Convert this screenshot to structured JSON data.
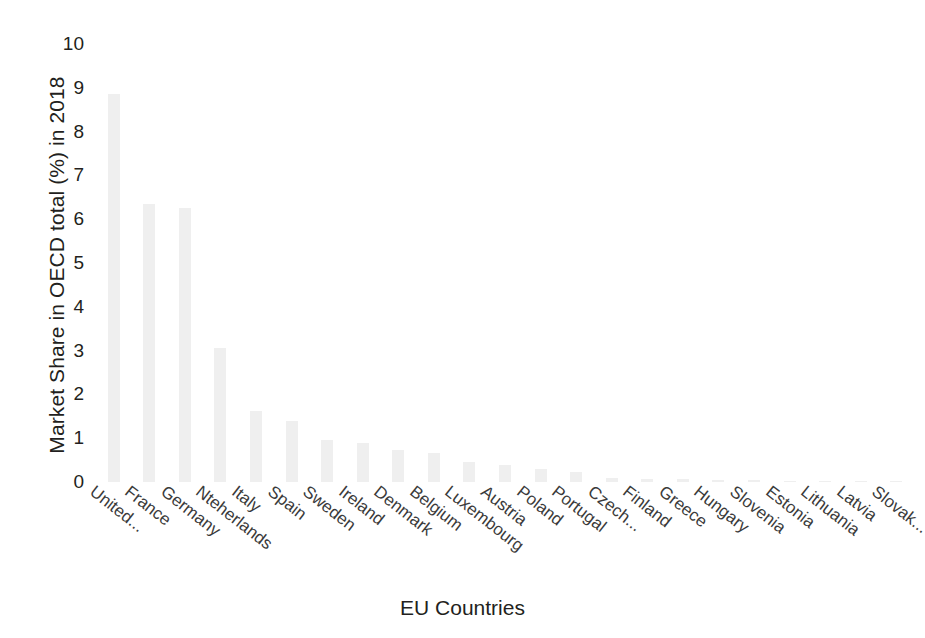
{
  "chart_data": {
    "type": "bar",
    "title": "",
    "xlabel": "EU Countries",
    "ylabel": "Market Share in OECD total (%) in 2018",
    "ylim": [
      0,
      10
    ],
    "yticks": [
      0,
      1,
      2,
      3,
      4,
      5,
      6,
      7,
      8,
      9,
      10
    ],
    "grid": false,
    "legend": "none",
    "bar_color": "#efefef",
    "categories": [
      "United...",
      "France",
      "Germany",
      "Nteherlands",
      "Italy",
      "Spain",
      "Sweden",
      "Ireland",
      "Denmark",
      "Belgium",
      "Luxembourg",
      "Austria",
      "Poland",
      "Portugal",
      "Czech...",
      "Finland",
      "Greece",
      "Hungary",
      "Slovenia",
      "Estonia",
      "Lithuania",
      "Latvia",
      "Slovak..."
    ],
    "values": [
      8.85,
      6.35,
      6.25,
      3.07,
      1.63,
      1.4,
      0.95,
      0.88,
      0.72,
      0.66,
      0.45,
      0.38,
      0.3,
      0.22,
      0.1,
      0.07,
      0.06,
      0.05,
      0.04,
      0.02,
      0.01,
      0.01,
      0.01
    ]
  }
}
